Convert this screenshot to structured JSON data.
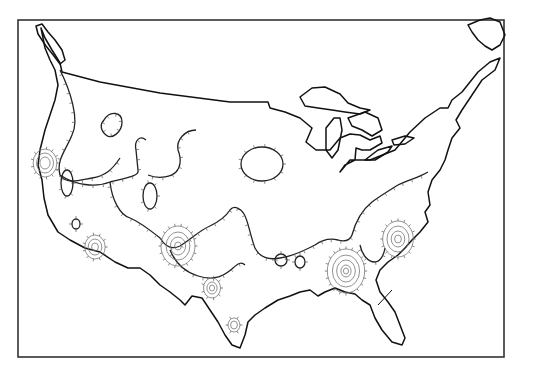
{
  "figure": {
    "header_fragment": "",
    "frame": {
      "x": 18,
      "y": 20,
      "width": 486,
      "height": 337
    },
    "colors": {
      "coast": "#111111",
      "contour": "#222222",
      "ring": "#777777",
      "frame": "#333333",
      "background": "#ffffff"
    }
  },
  "geography": {
    "us_outline": "M41,28 L45,38 L52,50 L57,58 L60,63 L62,72 L100,82 L160,93 L230,102 L268,102 L270,108 L285,112 L300,118 L312,128 L306,142 L316,150 L330,150 L340,138 L350,134 L360,135 L370,140 L380,136 L382,143 L370,150 L362,150 L356,148 L355,160 L345,165 L340,172 L350,160 L370,160 L395,150 L410,132 L425,118 L440,108 L448,108 L452,100 L462,92 L470,82 L478,72 L490,62 L500,58 L495,70 L482,80 L470,98 L462,110 L456,120 L460,128 L452,138 L448,150 L445,160 L440,170 L432,180 L428,192 L430,205 L425,212 L428,222 L420,232 L412,240 L405,248 L398,255 L388,262 L380,270 L376,280 L380,292 L388,302 L395,312 L400,325 L405,338 L402,345 L392,342 L382,330 L375,318 L370,305 L362,300 L355,294 L345,292 L335,288 L325,292 L318,296 L310,290 L300,292 L290,296 L278,300 L265,308 L255,315 L248,322 L245,335 L240,348 L232,345 L225,335 L218,322 L210,310 L202,298 L192,296 L185,305 L180,300 L170,292 L160,285 L150,275 L140,268 L128,268 L115,262 L100,252 L85,248 L70,240 L58,232 L48,215 L44,198 L42,180 L38,165 L40,150 L45,130 L50,115 L55,100 L58,85 L55,70 L50,60 L45,48 Z",
    "vancouver_island": "M36,26 L42,24 L48,32 L55,40 L62,50 L65,60 L60,64 L54,56 L46,46 L38,34 Z",
    "newfoundland": "M468,25 L480,20 L490,18 L500,22 L505,35 L500,45 L492,50 L485,46 L478,40 L472,32 Z",
    "lakes": [
      {
        "name": "Lake Superior",
        "d": "M300,97 L312,88 L325,87 L340,94 L348,103 L360,108 L370,110 L360,114 L345,112 L332,110 L318,108 L305,106 Z"
      },
      {
        "name": "Lake Michigan",
        "d": "M326,128 L334,118 L340,118 L342,130 L338,150 L332,158 L326,150 L326,138 Z"
      },
      {
        "name": "Lake Huron",
        "d": "M348,118 L365,112 L378,118 L382,130 L372,136 L362,130 L352,126 Z"
      },
      {
        "name": "Lake Erie",
        "d": "M365,160 L378,150 L392,146 L388,152 L375,160 Z"
      },
      {
        "name": "Lake Ontario",
        "d": "M392,140 L405,136 L414,138 L405,144 L394,145 Z"
      }
    ],
    "florida_division": "M378,305 L392,290"
  },
  "contours": {
    "lines": [
      {
        "id": "nw-lobe",
        "d": "M60,70 C70,90 80,120 72,135 C66,150 56,160 60,175 C66,185 80,180 92,178 C105,176 112,170 120,158"
      },
      {
        "id": "n-plains-loop",
        "d": "M104,120 C110,110 122,112 122,122 C122,132 112,140 106,135 C100,130 100,124 104,120 Z"
      },
      {
        "id": "west-main",
        "d": "M60,175 C75,185 95,188 110,182 C126,178 140,176 138,170 L136,150 C134,140 140,135 146,140"
      },
      {
        "id": "west-central",
        "d": "M148,175 C160,180 172,176 176,172 C180,168 182,160 178,150 C176,140 185,130 196,130"
      },
      {
        "id": "central-descender",
        "d": "M110,182 C112,200 120,215 130,218 C140,222 150,230 160,238 C165,246 172,250 180,246 C190,240 200,230 210,226"
      },
      {
        "id": "mid-south",
        "d": "M210,226 C218,222 225,218 230,210 C234,205 240,208 244,214 C248,220 250,235 255,248 C260,258 270,260 280,258"
      },
      {
        "id": "gulf-coast-band",
        "d": "M280,258 C295,256 305,250 315,245 C322,240 330,238 338,240 C345,242 350,240 352,235"
      },
      {
        "id": "east-band",
        "d": "M352,235 C356,220 362,210 372,202 C380,196 390,190 398,185 C408,180 418,178 428,172"
      },
      {
        "id": "southeast-arm",
        "d": "M360,245 C362,255 368,262 375,262 C380,262 384,255 385,248"
      },
      {
        "id": "texas-lobe",
        "d": "M170,250 C175,262 185,272 198,276 C210,280 220,278 228,272 C236,266 240,260 245,265"
      }
    ],
    "closed_lows": [
      {
        "id": "iowa-ellipse",
        "cx": 262,
        "cy": 164,
        "rx": 21,
        "ry": 17
      },
      {
        "id": "nv-oval",
        "cx": 67,
        "cy": 183,
        "rx": 6,
        "ry": 13
      },
      {
        "id": "colo-oval",
        "cx": 150,
        "cy": 196,
        "rx": 7,
        "ry": 13
      },
      {
        "id": "az-small",
        "cx": 76,
        "cy": 224,
        "rx": 4,
        "ry": 5
      },
      {
        "id": "ok-dot",
        "cx": 281,
        "cy": 260,
        "rx": 6,
        "ry": 6
      },
      {
        "id": "sw-tiny",
        "cx": 300,
        "cy": 262,
        "rx": 5,
        "ry": 6
      }
    ],
    "maxima": [
      {
        "id": "n-california",
        "cx": 45,
        "cy": 163,
        "rings": [
          14,
          10,
          6
        ]
      },
      {
        "id": "s-california",
        "cx": 95,
        "cy": 247,
        "rings": [
          12,
          8,
          4
        ]
      },
      {
        "id": "az-nm",
        "cx": 178,
        "cy": 246,
        "rings": [
          20,
          14,
          9,
          4
        ]
      },
      {
        "id": "w-texas",
        "cx": 212,
        "cy": 288,
        "rings": [
          10,
          6,
          3
        ]
      },
      {
        "id": "s-texas",
        "cx": 234,
        "cy": 325,
        "rings": [
          7,
          4
        ]
      },
      {
        "id": "mississippi-alabama",
        "cx": 346,
        "cy": 271,
        "rings": [
          22,
          16,
          11,
          6,
          3
        ]
      },
      {
        "id": "carolinas",
        "cx": 398,
        "cy": 239,
        "rings": [
          18,
          13,
          8,
          4
        ]
      }
    ]
  }
}
